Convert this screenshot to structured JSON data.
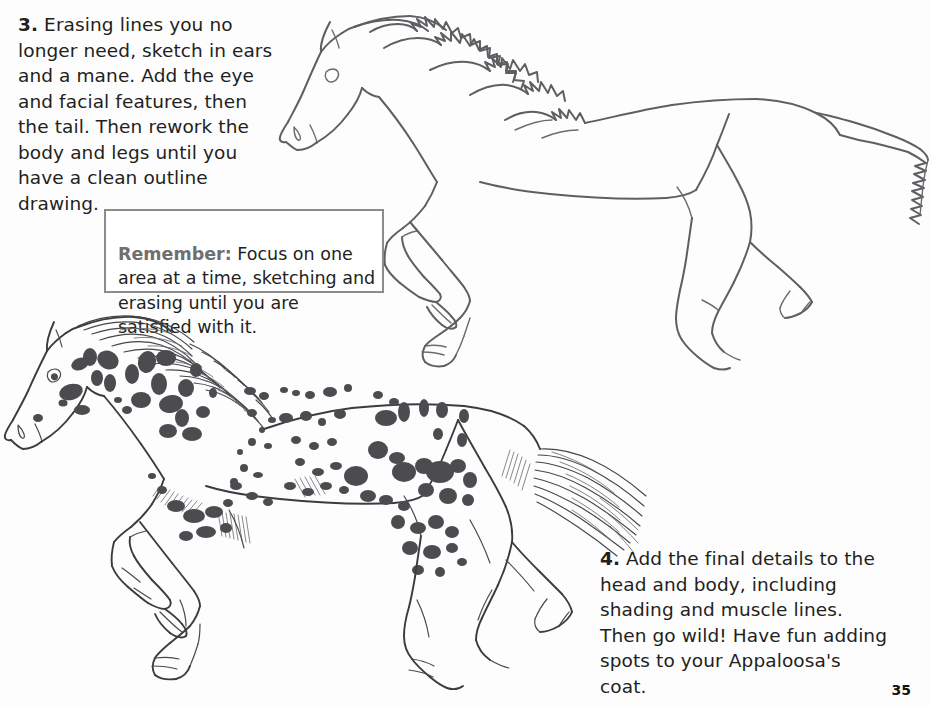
{
  "page": {
    "number": "35",
    "background_color": "#fdfdfd",
    "ink_color": "#5f5f63",
    "spot_color": "#4b4b50"
  },
  "steps": [
    {
      "number": "3.",
      "text": "3. Erasing lines you no longer need, sketch in ears and a mane. Add the eye and facial features, then the tail. Then rework the body and legs until you have a clean outline drawing."
    },
    {
      "number": "4.",
      "text": "4. Add the final details to the head and body, including shading and muscle lines. Then go wild! Have fun adding spots to your Appaloosa's coat."
    }
  ],
  "remember_box": {
    "lead": "Remember:",
    "text": "Remember: Focus on one area at a time, sketching and erasing until you are satisfied with it.",
    "border_color": "#8c8c8c",
    "lead_color": "#6f6f6f"
  },
  "illustrations": [
    {
      "name": "horse-outline",
      "caption": "Clean outline drawing of a trotting horse with sketched mane, ears, eye and tail"
    },
    {
      "name": "horse-appaloosa",
      "caption": "Finished Appaloosa horse with spotted coat, shading, muscle lines, flowing mane and tail"
    }
  ]
}
